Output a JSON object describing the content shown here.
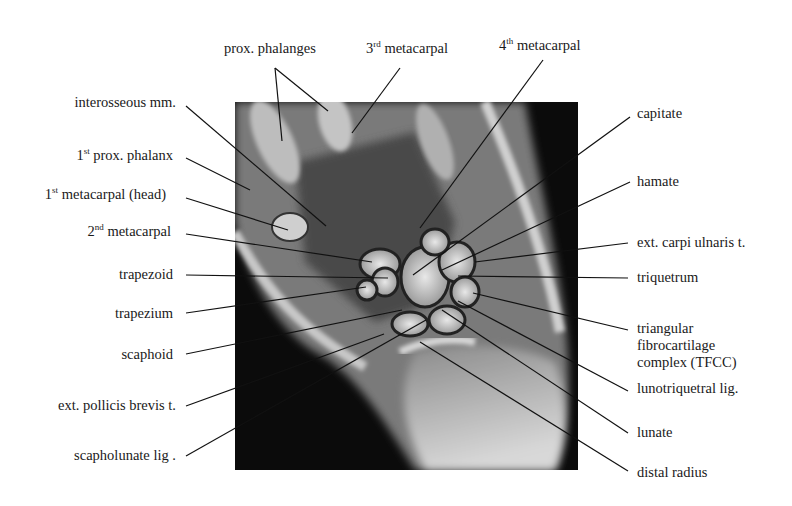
{
  "figure": {
    "background_color": "#ffffff",
    "image_color": "#0b0b0b"
  },
  "labels_top": [
    {
      "id": "prox-phalanges",
      "text": "prox. phalanges"
    },
    {
      "id": "3rd-metacarpal",
      "num": "3",
      "sup": "rd",
      "text": " metacarpal"
    },
    {
      "id": "4th-metacarpal",
      "num": "4",
      "sup": "th",
      "text": " metacarpal"
    }
  ],
  "labels_left": [
    {
      "id": "interosseous-mm",
      "text": "interosseous  mm."
    },
    {
      "id": "1st-prox-phalanx",
      "num": "1",
      "sup": "st",
      "text": " prox. phalanx"
    },
    {
      "id": "1st-metacarpal-head",
      "num": "1",
      "sup": "st",
      "text": " metacarpal (head)"
    },
    {
      "id": "2nd-metacarpal",
      "num": "2",
      "sup": "nd",
      "text": " metacarpal"
    },
    {
      "id": "trapezoid",
      "text": "trapezoid"
    },
    {
      "id": "trapezium",
      "text": "trapezium"
    },
    {
      "id": "scaphoid",
      "text": "scaphoid"
    },
    {
      "id": "ext-pollicis-brevis",
      "text": "ext. pollicis  brevis t."
    },
    {
      "id": "scapholunate-lig",
      "text": "scapholunate lig ."
    }
  ],
  "labels_right": [
    {
      "id": "capitate",
      "text": "capitate"
    },
    {
      "id": "hamate",
      "text": "hamate"
    },
    {
      "id": "ext-carpi-ulnaris",
      "text": "ext. carpi ulnaris t."
    },
    {
      "id": "triquetrum",
      "text": "triquetrum"
    },
    {
      "id": "tfcc-1",
      "text": "triangular"
    },
    {
      "id": "tfcc-2",
      "text": "fibrocartilage"
    },
    {
      "id": "tfcc-3",
      "text": "complex (TFCC)"
    },
    {
      "id": "lunotriquetral-lig",
      "text": "lunotriquetral  lig."
    },
    {
      "id": "lunate",
      "text": "lunate"
    },
    {
      "id": "distal-radius",
      "text": "distal radius"
    }
  ]
}
